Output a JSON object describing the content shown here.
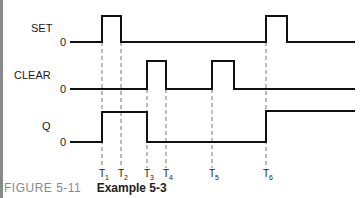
{
  "signals": [
    {
      "name": "SET",
      "zero_label": "0"
    },
    {
      "name": "CLEAR",
      "zero_label": "0"
    },
    {
      "name": "Q",
      "zero_label": "0"
    }
  ],
  "time_markers": [
    {
      "base": "T",
      "sub": "1"
    },
    {
      "base": "T",
      "sub": "2"
    },
    {
      "base": "T",
      "sub": "3"
    },
    {
      "base": "T",
      "sub": "4"
    },
    {
      "base": "T",
      "sub": "5"
    },
    {
      "base": "T",
      "sub": "6"
    }
  ],
  "caption": {
    "figure": "FIGURE 5-11",
    "title": "Example 5-3"
  },
  "colors": {
    "waveform": "#111111",
    "dashed": "#777777",
    "figure_label": "#8a8a8a"
  }
}
